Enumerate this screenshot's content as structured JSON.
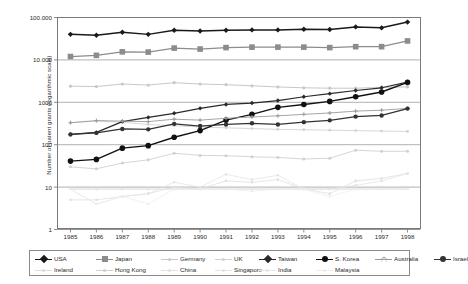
{
  "chart_data": {
    "type": "line",
    "title": "",
    "xlabel": "",
    "ylabel": "Number of patent grants (logarithmic scale)",
    "scale": "log",
    "grid": true,
    "legend_position": "bottom",
    "ylim": [
      1,
      100000
    ],
    "y_ticks": [
      1,
      10,
      100,
      1000,
      10000,
      100000
    ],
    "y_tick_labels": [
      "1",
      "10",
      "100",
      "1000",
      "10.000",
      "100.000"
    ],
    "categories": [
      "1985",
      "1986",
      "1987",
      "1988",
      "1989",
      "1990",
      "1991",
      "1992",
      "1993",
      "1994",
      "1995",
      "1996",
      "1997",
      "1998"
    ],
    "series": [
      {
        "name": "USA",
        "color": "#1a1a1a",
        "marker": "diamond",
        "size": 5.4,
        "width": 1.5,
        "values": [
          40000,
          38000,
          45000,
          40000,
          50000,
          48000,
          50000,
          51000,
          51000,
          53000,
          52000,
          60000,
          57000,
          78000
        ]
      },
      {
        "name": "Japan",
        "color": "#8c8c8c",
        "marker": "square",
        "size": 5.6,
        "width": 1.3,
        "values": [
          12000,
          12800,
          15500,
          15300,
          19000,
          18000,
          19500,
          20000,
          20000,
          20000,
          19500,
          20500,
          20500,
          28000
        ]
      },
      {
        "name": "Germany",
        "color": "#c8c8c8",
        "marker": "round",
        "size": 3.2,
        "width": 1.0,
        "values": [
          2400,
          2350,
          2700,
          2550,
          2900,
          2700,
          2600,
          2450,
          2300,
          2200,
          2150,
          2150,
          2250,
          2300
        ]
      },
      {
        "name": "UK",
        "color": "#d2d2d2",
        "marker": "round",
        "size": 2.8,
        "width": 0.9,
        "values": [
          330,
          360,
          340,
          300,
          280,
          260,
          250,
          240,
          230,
          225,
          220,
          215,
          210,
          205
        ]
      },
      {
        "name": "Taiwan",
        "color": "#2a2a2a",
        "marker": "diamond",
        "size": 4.4,
        "width": 1.2,
        "values": [
          175,
          195,
          350,
          440,
          550,
          720,
          890,
          960,
          1100,
          1350,
          1600,
          1900,
          2200,
          3000
        ]
      },
      {
        "name": "S. Korea",
        "color": "#111111",
        "marker": "round",
        "size": 5.6,
        "width": 1.4,
        "values": [
          41,
          45,
          83,
          95,
          150,
          215,
          380,
          520,
          760,
          890,
          1050,
          1350,
          1750,
          2950
        ]
      },
      {
        "name": "Australia",
        "color": "#9b9b9b",
        "marker": "cross",
        "size": 4.0,
        "width": 0.9,
        "values": [
          330,
          370,
          360,
          350,
          400,
          380,
          420,
          450,
          480,
          520,
          560,
          620,
          650,
          720
        ]
      },
      {
        "name": "Israel",
        "color": "#333333",
        "marker": "round",
        "size": 4.4,
        "width": 1.2,
        "values": [
          175,
          190,
          235,
          230,
          310,
          275,
          300,
          320,
          300,
          340,
          375,
          460,
          490,
          710
        ]
      },
      {
        "name": "Ireland",
        "color": "#dcdcdc",
        "marker": "round",
        "size": 2.6,
        "width": 0.8,
        "values": [
          9,
          9,
          9,
          9,
          9,
          9,
          9,
          9,
          9,
          9,
          9,
          9,
          9,
          9
        ]
      },
      {
        "name": "Hong Kong",
        "color": "#d0d0d0",
        "marker": "round",
        "size": 3.0,
        "width": 0.9,
        "values": [
          30,
          27,
          37,
          44,
          63,
          56,
          55,
          52,
          50,
          46,
          48,
          74,
          70,
          70
        ]
      },
      {
        "name": "China",
        "color": "#e0e0e0",
        "marker": "round",
        "size": 2.6,
        "width": 0.8,
        "values": [
          5,
          5,
          6,
          7,
          10,
          9,
          14,
          13,
          15,
          9,
          7,
          14,
          16,
          21
        ]
      },
      {
        "name": "Singapore",
        "color": "#e4e4e4",
        "marker": "round",
        "size": 2.6,
        "width": 0.8,
        "values": [
          9,
          4,
          6,
          7,
          13,
          10,
          20,
          15,
          19,
          9,
          9,
          11,
          14,
          21
        ]
      },
      {
        "name": "India",
        "color": "#e6e6e6",
        "marker": "round",
        "size": 2.4,
        "width": 0.8,
        "values": [
          9,
          9,
          9,
          9,
          9,
          9,
          9,
          9,
          9,
          9,
          9,
          9,
          9,
          9
        ]
      },
      {
        "name": "Malaysia",
        "color": "#ededed",
        "marker": "round",
        "size": 2.4,
        "width": 0.8,
        "values": [
          9,
          4,
          6,
          4,
          9,
          9,
          9,
          8,
          9,
          9,
          6,
          9,
          9,
          9
        ]
      }
    ]
  },
  "axes": {
    "y_title": "Number of patent grants (logarithmic scale)",
    "y_labels": [
      "100.000",
      "10.000",
      "1000",
      "100",
      "10",
      "1"
    ],
    "x_labels": [
      "1985",
      "1986",
      "1987",
      "1988",
      "1989",
      "1990",
      "1991",
      "1992",
      "1993",
      "1994",
      "1995",
      "1996",
      "1997",
      "1998"
    ]
  },
  "legend": {
    "row1": [
      "USA",
      "Japan",
      "Germany",
      "UK",
      "Taiwan",
      "S. Korea",
      "Australia",
      "Israel"
    ],
    "row2": [
      "Ireland",
      "Hong Kong",
      "China",
      "Singapore",
      "India",
      "Malaysia"
    ]
  }
}
